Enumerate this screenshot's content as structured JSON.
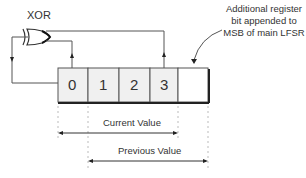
{
  "gate": {
    "label": "XOR"
  },
  "register": {
    "cells": [
      "0",
      "1",
      "2",
      "3",
      ""
    ]
  },
  "annotation": {
    "lines": [
      "Additional register",
      "bit appended to",
      "MSB of main LFSR"
    ]
  },
  "ranges": {
    "current": "Current Value",
    "previous": "Previous Value"
  },
  "colors": {
    "line": "#555555",
    "cell_fill": "#f0f0f0",
    "cell_border": "#444444",
    "text": "#333333"
  }
}
